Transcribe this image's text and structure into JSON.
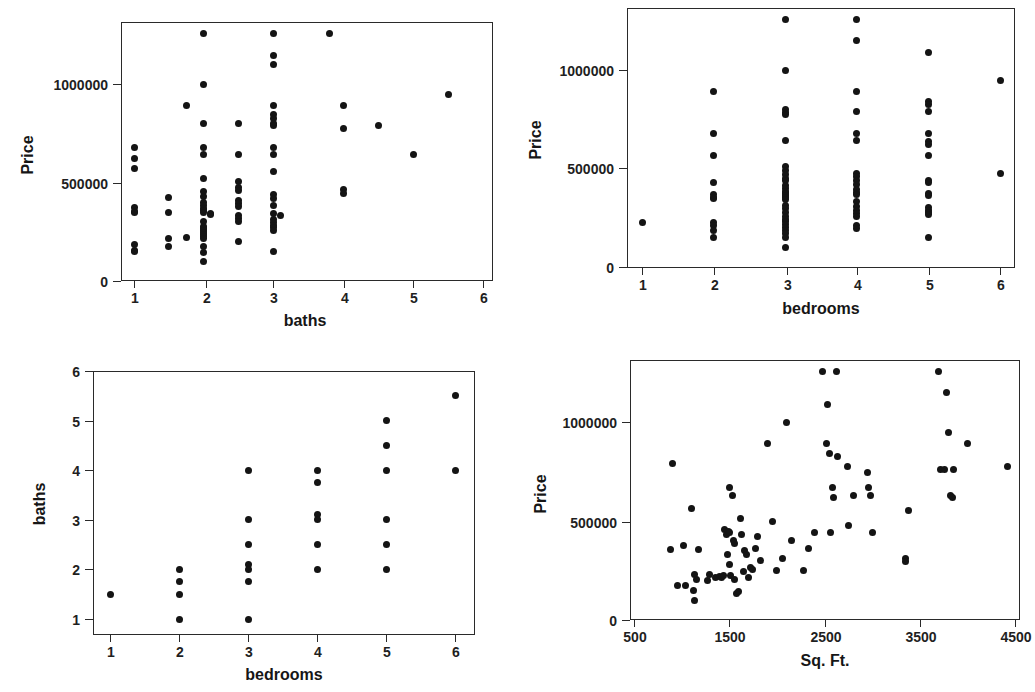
{
  "figure": {
    "type": "scatter-matrix",
    "panel_count": 4,
    "background": "#ffffff",
    "point_color": "#141414",
    "axis_color": "#2a2a2a"
  },
  "chart_data": [
    {
      "id": "price-vs-baths",
      "type": "scatter",
      "title": "",
      "xlabel": "baths",
      "ylabel": "Price",
      "xlim": [
        0.6,
        6.3
      ],
      "ylim": [
        -60000,
        1290000
      ],
      "xticks": [
        1,
        2,
        3,
        4,
        5,
        6
      ],
      "xticklabels": [
        "1",
        "2",
        "3",
        "4",
        "5",
        "6"
      ],
      "yticks": [
        0,
        500000,
        1000000
      ],
      "yticklabels": [
        "0",
        "500000",
        "1000000"
      ],
      "grid": false,
      "legend": "none",
      "points": [
        [
          1,
          680000
        ],
        [
          1,
          620000
        ],
        [
          1,
          570000
        ],
        [
          1,
          375000
        ],
        [
          1,
          355000
        ],
        [
          1,
          350000
        ],
        [
          1,
          185000
        ],
        [
          1,
          155000
        ],
        [
          1,
          148000
        ],
        [
          1.5,
          425000
        ],
        [
          1.5,
          350000
        ],
        [
          1.5,
          215000
        ],
        [
          1.5,
          175000
        ],
        [
          1.75,
          890000
        ],
        [
          1.75,
          220000
        ],
        [
          2,
          1255000
        ],
        [
          2,
          1000000
        ],
        [
          2,
          800000
        ],
        [
          2,
          680000
        ],
        [
          2,
          640000
        ],
        [
          2,
          520000
        ],
        [
          2,
          455000
        ],
        [
          2,
          430000
        ],
        [
          2,
          400000
        ],
        [
          2,
          385000
        ],
        [
          2,
          370000
        ],
        [
          2,
          360000
        ],
        [
          2,
          350000
        ],
        [
          2,
          300000
        ],
        [
          2,
          275000
        ],
        [
          2,
          265000
        ],
        [
          2,
          255000
        ],
        [
          2,
          245000
        ],
        [
          2,
          235000
        ],
        [
          2,
          225000
        ],
        [
          2,
          215000
        ],
        [
          2,
          175000
        ],
        [
          2,
          145000
        ],
        [
          2,
          100000
        ],
        [
          2.1,
          345000
        ],
        [
          2.1,
          340000
        ],
        [
          2.5,
          800000
        ],
        [
          2.5,
          640000
        ],
        [
          2.5,
          505000
        ],
        [
          2.5,
          475000
        ],
        [
          2.5,
          460000
        ],
        [
          2.5,
          410000
        ],
        [
          2.5,
          395000
        ],
        [
          2.5,
          380000
        ],
        [
          2.5,
          330000
        ],
        [
          2.5,
          315000
        ],
        [
          2.5,
          300000
        ],
        [
          2.5,
          200000
        ],
        [
          3,
          1255000
        ],
        [
          3,
          1145000
        ],
        [
          3,
          1100000
        ],
        [
          3,
          890000
        ],
        [
          3,
          845000
        ],
        [
          3,
          825000
        ],
        [
          3,
          800000
        ],
        [
          3,
          790000
        ],
        [
          3,
          680000
        ],
        [
          3,
          640000
        ],
        [
          3,
          555000
        ],
        [
          3,
          440000
        ],
        [
          3,
          420000
        ],
        [
          3,
          385000
        ],
        [
          3,
          345000
        ],
        [
          3,
          310000
        ],
        [
          3,
          295000
        ],
        [
          3,
          280000
        ],
        [
          3,
          270000
        ],
        [
          3,
          255000
        ],
        [
          3,
          150000
        ],
        [
          3.1,
          330000
        ],
        [
          3.8,
          1255000
        ],
        [
          4,
          890000
        ],
        [
          4,
          775000
        ],
        [
          4,
          465000
        ],
        [
          4,
          445000
        ],
        [
          4.5,
          790000
        ],
        [
          5,
          640000
        ],
        [
          5.5,
          945000
        ]
      ]
    },
    {
      "id": "price-vs-bedrooms",
      "type": "scatter",
      "title": "",
      "xlabel": "bedrooms",
      "ylabel": "Price",
      "xlim": [
        0.65,
        6.35
      ],
      "ylim": [
        -60000,
        1290000
      ],
      "xticks": [
        1,
        2,
        3,
        4,
        5,
        6
      ],
      "xticklabels": [
        "1",
        "2",
        "3",
        "4",
        "5",
        "6"
      ],
      "yticks": [
        0,
        500000,
        1000000
      ],
      "yticklabels": [
        "0",
        "500000",
        "1000000"
      ],
      "grid": false,
      "legend": "none",
      "points": [
        [
          1,
          225000
        ],
        [
          2,
          890000
        ],
        [
          2,
          680000
        ],
        [
          2,
          565000
        ],
        [
          2,
          430000
        ],
        [
          2,
          370000
        ],
        [
          2,
          355000
        ],
        [
          2,
          350000
        ],
        [
          2,
          225000
        ],
        [
          2,
          210000
        ],
        [
          2,
          185000
        ],
        [
          2,
          150000
        ],
        [
          3,
          1255000
        ],
        [
          3,
          1000000
        ],
        [
          3,
          800000
        ],
        [
          3,
          785000
        ],
        [
          3,
          775000
        ],
        [
          3,
          640000
        ],
        [
          3,
          510000
        ],
        [
          3,
          490000
        ],
        [
          3,
          470000
        ],
        [
          3,
          450000
        ],
        [
          3,
          440000
        ],
        [
          3,
          415000
        ],
        [
          3,
          400000
        ],
        [
          3,
          385000
        ],
        [
          3,
          375000
        ],
        [
          3,
          365000
        ],
        [
          3,
          355000
        ],
        [
          3,
          345000
        ],
        [
          3,
          310000
        ],
        [
          3,
          295000
        ],
        [
          3,
          275000
        ],
        [
          3,
          255000
        ],
        [
          3,
          240000
        ],
        [
          3,
          230000
        ],
        [
          3,
          215000
        ],
        [
          3,
          200000
        ],
        [
          3,
          185000
        ],
        [
          3,
          170000
        ],
        [
          3,
          150000
        ],
        [
          3,
          100000
        ],
        [
          4,
          1255000
        ],
        [
          4,
          1150000
        ],
        [
          4,
          890000
        ],
        [
          4,
          790000
        ],
        [
          4,
          680000
        ],
        [
          4,
          640000
        ],
        [
          4,
          475000
        ],
        [
          4,
          460000
        ],
        [
          4,
          440000
        ],
        [
          4,
          420000
        ],
        [
          4,
          395000
        ],
        [
          4,
          380000
        ],
        [
          4,
          370000
        ],
        [
          4,
          330000
        ],
        [
          4,
          305000
        ],
        [
          4,
          285000
        ],
        [
          4,
          270000
        ],
        [
          4,
          255000
        ],
        [
          4,
          210000
        ],
        [
          4,
          195000
        ],
        [
          5,
          1090000
        ],
        [
          5,
          840000
        ],
        [
          5,
          825000
        ],
        [
          5,
          790000
        ],
        [
          5,
          680000
        ],
        [
          5,
          635000
        ],
        [
          5,
          620000
        ],
        [
          5,
          565000
        ],
        [
          5,
          440000
        ],
        [
          5,
          430000
        ],
        [
          5,
          375000
        ],
        [
          5,
          365000
        ],
        [
          5,
          300000
        ],
        [
          5,
          285000
        ],
        [
          5,
          275000
        ],
        [
          5,
          265000
        ],
        [
          5,
          150000
        ],
        [
          6,
          945000
        ],
        [
          6,
          475000
        ]
      ]
    },
    {
      "id": "baths-vs-bedrooms",
      "type": "scatter",
      "title": "",
      "xlabel": "bedrooms",
      "ylabel": "baths",
      "xlim": [
        0.7,
        6.3
      ],
      "ylim": [
        0.65,
        6.1
      ],
      "xticks": [
        1,
        2,
        3,
        4,
        5,
        6
      ],
      "xticklabels": [
        "1",
        "2",
        "3",
        "4",
        "5",
        "6"
      ],
      "yticks": [
        1,
        2,
        3,
        4,
        5,
        6
      ],
      "yticklabels": [
        "1",
        "2",
        "3",
        "4",
        "5",
        "6"
      ],
      "grid": false,
      "legend": "none",
      "points": [
        [
          1,
          1.5
        ],
        [
          2,
          2.0
        ],
        [
          2,
          1.75
        ],
        [
          2,
          1.5
        ],
        [
          2,
          1.0
        ],
        [
          3,
          4.0
        ],
        [
          3,
          3.0
        ],
        [
          3,
          2.5
        ],
        [
          3,
          2.1
        ],
        [
          3,
          2.0
        ],
        [
          3,
          1.75
        ],
        [
          3,
          1.0
        ],
        [
          4,
          4.0
        ],
        [
          4,
          3.75
        ],
        [
          4,
          3.1
        ],
        [
          4,
          3.0
        ],
        [
          4,
          2.5
        ],
        [
          4,
          2.0
        ],
        [
          5,
          5.0
        ],
        [
          5,
          4.5
        ],
        [
          5,
          4.0
        ],
        [
          5,
          3.0
        ],
        [
          5,
          2.5
        ],
        [
          5,
          2.0
        ],
        [
          6,
          5.5
        ],
        [
          6,
          4.0
        ]
      ]
    },
    {
      "id": "price-vs-sqft",
      "type": "scatter",
      "title": "",
      "xlabel": "Sq. Ft.",
      "ylabel": "Price",
      "xlim": [
        420,
        4600
      ],
      "ylim": [
        -60000,
        1290000
      ],
      "xticks": [
        500,
        1500,
        2500,
        3500,
        4500
      ],
      "xticklabels": [
        "500",
        "1500",
        "2500",
        "3500",
        "4500"
      ],
      "yticks": [
        0,
        500000,
        1000000
      ],
      "yticklabels": [
        "0",
        "500000",
        "1000000"
      ],
      "grid": false,
      "legend": "none",
      "points": [
        [
          900,
          790000
        ],
        [
          880,
          355000
        ],
        [
          1020,
          375000
        ],
        [
          960,
          175000
        ],
        [
          1040,
          175000
        ],
        [
          1100,
          565000
        ],
        [
          1130,
          230000
        ],
        [
          1180,
          355000
        ],
        [
          1160,
          205000
        ],
        [
          1120,
          150000
        ],
        [
          1130,
          100000
        ],
        [
          1270,
          200000
        ],
        [
          1290,
          230000
        ],
        [
          1360,
          215000
        ],
        [
          1400,
          220000
        ],
        [
          1420,
          215000
        ],
        [
          1440,
          225000
        ],
        [
          1450,
          455000
        ],
        [
          1470,
          430000
        ],
        [
          1480,
          330000
        ],
        [
          1500,
          670000
        ],
        [
          1490,
          445000
        ],
        [
          1500,
          440000
        ],
        [
          1500,
          280000
        ],
        [
          1510,
          225000
        ],
        [
          1530,
          630000
        ],
        [
          1540,
          400000
        ],
        [
          1560,
          385000
        ],
        [
          1560,
          205000
        ],
        [
          1580,
          135000
        ],
        [
          1600,
          145000
        ],
        [
          1620,
          515000
        ],
        [
          1630,
          430000
        ],
        [
          1650,
          245000
        ],
        [
          1660,
          350000
        ],
        [
          1680,
          330000
        ],
        [
          1700,
          215000
        ],
        [
          1720,
          265000
        ],
        [
          1740,
          255000
        ],
        [
          1780,
          360000
        ],
        [
          1800,
          420000
        ],
        [
          1830,
          300000
        ],
        [
          1900,
          890000
        ],
        [
          1950,
          495000
        ],
        [
          2000,
          250000
        ],
        [
          2060,
          310000
        ],
        [
          2100,
          1000000
        ],
        [
          2150,
          400000
        ],
        [
          2280,
          250000
        ],
        [
          2330,
          360000
        ],
        [
          2400,
          440000
        ],
        [
          2480,
          1255000
        ],
        [
          2530,
          1090000
        ],
        [
          2520,
          890000
        ],
        [
          2550,
          840000
        ],
        [
          2560,
          440000
        ],
        [
          2580,
          670000
        ],
        [
          2590,
          620000
        ],
        [
          2630,
          1255000
        ],
        [
          2640,
          825000
        ],
        [
          2740,
          775000
        ],
        [
          2750,
          475000
        ],
        [
          2800,
          630000
        ],
        [
          2950,
          745000
        ],
        [
          2960,
          670000
        ],
        [
          2980,
          630000
        ],
        [
          3000,
          440000
        ],
        [
          3350,
          310000
        ],
        [
          3350,
          295000
        ],
        [
          3380,
          555000
        ],
        [
          3700,
          1255000
        ],
        [
          3720,
          760000
        ],
        [
          3760,
          760000
        ],
        [
          3780,
          1150000
        ],
        [
          3800,
          945000
        ],
        [
          3820,
          630000
        ],
        [
          3840,
          620000
        ],
        [
          3850,
          760000
        ],
        [
          4000,
          890000
        ],
        [
          4420,
          775000
        ]
      ]
    }
  ]
}
